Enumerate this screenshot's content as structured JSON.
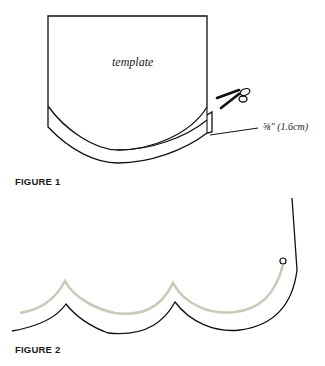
{
  "figure1": {
    "caption": "FIGURE 1",
    "template_label": "template",
    "allowance_label": "⅝\" (1.6cm)",
    "icon": "scissors-icon"
  },
  "figure2": {
    "caption": "FIGURE 2",
    "stitch_line_color": "#c9c9b8",
    "outline_color": "#111111"
  }
}
